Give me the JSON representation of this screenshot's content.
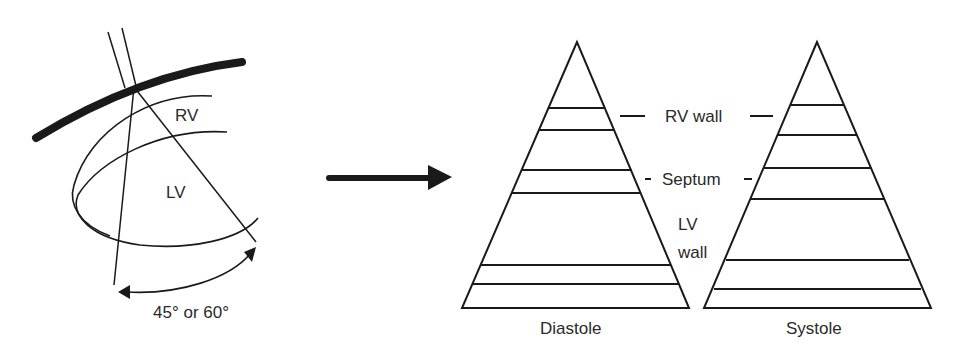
{
  "left_panel": {
    "labels": {
      "rv": "RV",
      "lv": "LV",
      "angle": "45° or 60°"
    }
  },
  "arrow": {
    "direction": "right"
  },
  "right_panel": {
    "layer_labels": {
      "rv_wall": "RV wall",
      "septum": "Septum",
      "lv_line1": "LV",
      "lv_line2": "wall"
    },
    "diastole_label": "Diastole",
    "systole_label": "Systole"
  }
}
